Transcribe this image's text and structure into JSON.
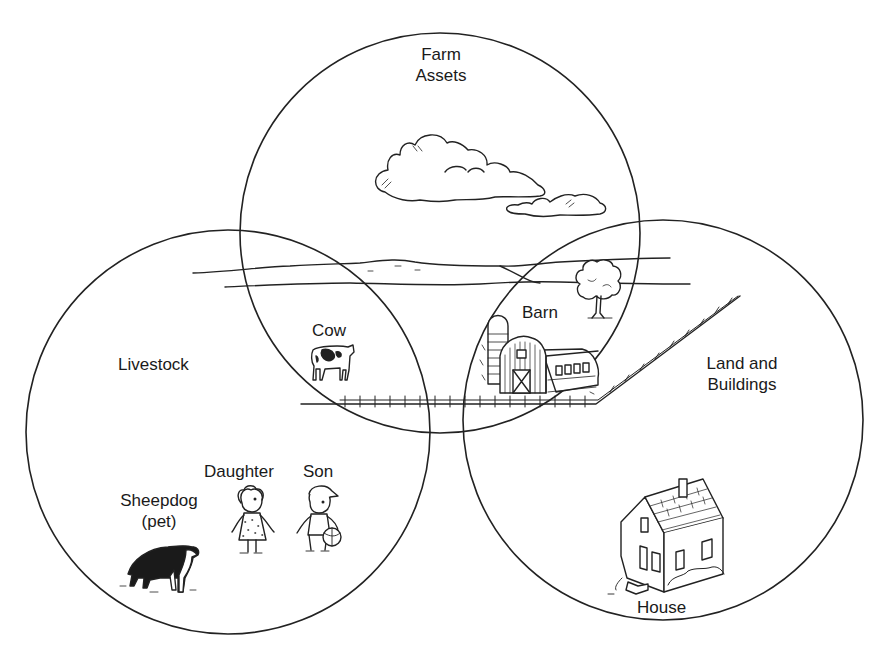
{
  "diagram": {
    "type": "venn",
    "sets": [
      {
        "id": "farm-assets",
        "label_lines": [
          "Farm",
          "Assets"
        ],
        "cx": 440,
        "cy": 233,
        "r": 200
      },
      {
        "id": "livestock",
        "label_lines": [
          "Livestock"
        ],
        "cx": 228,
        "cy": 432,
        "r": 202
      },
      {
        "id": "land-and-buildings",
        "label_lines": [
          "Land and",
          "Buildings"
        ],
        "cx": 663,
        "cy": 420,
        "r": 200
      }
    ],
    "items": [
      {
        "id": "cow",
        "label": "Cow",
        "sets": [
          "farm-assets",
          "livestock"
        ]
      },
      {
        "id": "barn",
        "label": "Barn",
        "sets": [
          "farm-assets",
          "land-and-buildings"
        ]
      },
      {
        "id": "daughter",
        "label": "Daughter",
        "sets": [
          "livestock"
        ]
      },
      {
        "id": "son",
        "label": "Son",
        "sets": [
          "livestock"
        ]
      },
      {
        "id": "sheepdog",
        "label_lines": [
          "Sheepdog",
          "(pet)"
        ],
        "sets": [
          "livestock"
        ]
      },
      {
        "id": "house",
        "label": "House",
        "sets": [
          "land-and-buildings"
        ]
      }
    ],
    "stroke_color": "#222222",
    "background": "#ffffff"
  },
  "labels": {
    "farm_assets_1": "Farm",
    "farm_assets_2": "Assets",
    "livestock": "Livestock",
    "land_1": "Land and",
    "land_2": "Buildings",
    "cow": "Cow",
    "barn": "Barn",
    "daughter": "Daughter",
    "son": "Son",
    "sheepdog_1": "Sheepdog",
    "sheepdog_2": "(pet)",
    "house": "House"
  }
}
